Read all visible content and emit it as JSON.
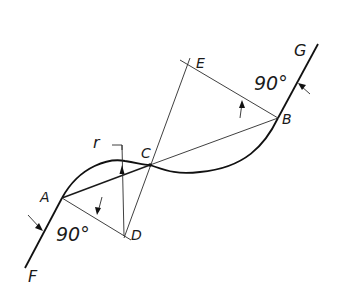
{
  "diagram": {
    "points": {
      "A": {
        "label": "A",
        "x": 62,
        "y": 198
      },
      "B": {
        "label": "B",
        "x": 278,
        "y": 118
      },
      "C": {
        "label": "C",
        "x": 150,
        "y": 165
      },
      "D": {
        "label": "D",
        "x": 124,
        "y": 236
      },
      "E": {
        "label": "E",
        "x": 188,
        "y": 62
      },
      "F": {
        "label": "F"
      },
      "G": {
        "label": "G"
      }
    },
    "labels": {
      "radius": "r",
      "angle_A": "90°",
      "angle_B": "90°"
    },
    "colors": {
      "stroke": "#1a1a1a",
      "background": "#ffffff"
    }
  }
}
